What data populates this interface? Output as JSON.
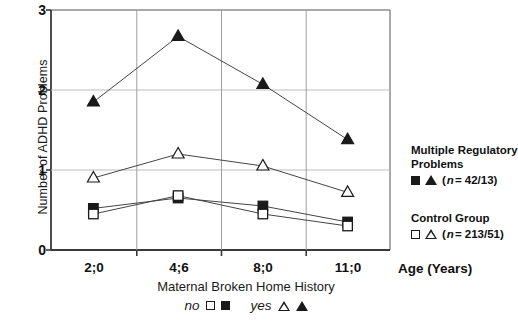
{
  "chart_data": {
    "type": "line",
    "title": "",
    "categories": [
      "2;0",
      "4;6",
      "8;0",
      "11;0"
    ],
    "xlabel": "Age (Years)",
    "ylabel": "Number of ADHD Problems",
    "ylim": [
      0,
      3
    ],
    "yticks": [
      "0",
      "1",
      "2",
      "3"
    ],
    "grid": "both",
    "legend_position": "right",
    "series": [
      {
        "name": "Multiple Regulatory Problems / yes",
        "marker": "filled-triangle",
        "values": [
          1.85,
          2.67,
          2.07,
          1.38
        ]
      },
      {
        "name": "Control Group / yes",
        "marker": "open-triangle",
        "values": [
          0.9,
          1.2,
          1.05,
          0.72
        ]
      },
      {
        "name": "Multiple Regulatory Problems / no",
        "marker": "filled-square",
        "values": [
          0.52,
          0.65,
          0.55,
          0.35
        ]
      },
      {
        "name": "Control Group / no",
        "marker": "open-square",
        "values": [
          0.45,
          0.68,
          0.45,
          0.3
        ]
      }
    ],
    "annotations": {
      "sub_axis_title": "Maternal Broken Home History",
      "symbol_key_no": "no",
      "symbol_key_yes": "yes"
    }
  },
  "legend": {
    "multiple_regulatory": {
      "title_line1": "Multiple Regulatory",
      "title_line2": "Problems",
      "n_prefix": "(",
      "n_italic": "n",
      "n_value": " = 42/13)"
    },
    "control_group": {
      "title_line1": "Control Group",
      "n_prefix": "(",
      "n_italic": "n",
      "n_value": " = 213/51)"
    }
  },
  "colors": {
    "ink": "#1a1a1a",
    "axis": "#444444",
    "grid": "#b8b8b8",
    "background": "#ffffff"
  }
}
